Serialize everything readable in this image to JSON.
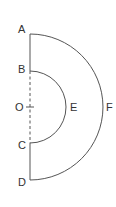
{
  "diagram": {
    "colors": {
      "stroke": "#555555",
      "text": "#333333",
      "background": "#ffffff"
    },
    "center": {
      "label": "O",
      "x": 30,
      "y": 107
    },
    "outer_semicircle": {
      "start": "A",
      "end": "D",
      "mid_label": "F",
      "radius": 73
    },
    "inner_semicircle": {
      "start": "B",
      "end": "C",
      "mid_label": "E",
      "radius": 36
    },
    "segments": [
      {
        "from": "A",
        "to": "B",
        "style": "solid"
      },
      {
        "from": "B",
        "to": "C",
        "style": "dashed"
      },
      {
        "from": "C",
        "to": "D",
        "style": "solid"
      }
    ],
    "labels": {
      "A": "A",
      "B": "B",
      "O": "O",
      "C": "C",
      "D": "D",
      "E": "E",
      "F": "F"
    }
  }
}
